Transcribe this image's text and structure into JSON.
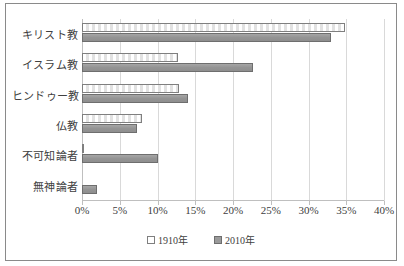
{
  "chart_data": {
    "type": "bar",
    "orientation": "horizontal",
    "title": "",
    "xlabel": "",
    "ylabel": "",
    "xlim": [
      0,
      40
    ],
    "xtick_labels": [
      "0%",
      "5%",
      "10%",
      "15%",
      "20%",
      "25%",
      "30%",
      "35%",
      "40%"
    ],
    "xticks": [
      0,
      5,
      10,
      15,
      20,
      25,
      30,
      35,
      40
    ],
    "grid": true,
    "legend_position": "bottom",
    "categories": [
      "キリスト教",
      "イスラム教",
      "ヒンドゥー教",
      "仏教",
      "不可知論者",
      "無神論者"
    ],
    "series": [
      {
        "name": "1910年",
        "color": "#ffffff",
        "values": [
          34.8,
          12.7,
          12.8,
          8.0,
          0.2,
          0.0
        ]
      },
      {
        "name": "2010年",
        "color": "#9a9a9a",
        "values": [
          33.0,
          22.6,
          14.0,
          7.3,
          10.0,
          2.0
        ]
      }
    ]
  },
  "legend": {
    "items": [
      {
        "label": "1910年"
      },
      {
        "label": "2010年"
      }
    ]
  }
}
